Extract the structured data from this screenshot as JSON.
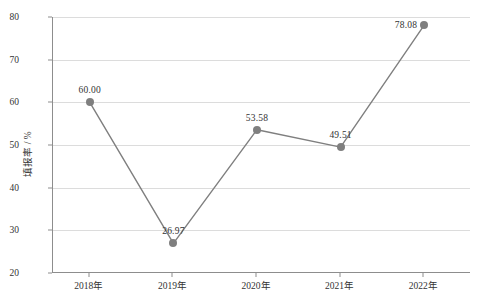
{
  "chart_data": {
    "type": "line",
    "title": "",
    "xlabel": "",
    "ylabel": "填报率 / %",
    "categories": [
      "2018年",
      "2019年",
      "2020年",
      "2021年",
      "2022年"
    ],
    "values": [
      60.0,
      26.97,
      53.58,
      49.51,
      78.08
    ],
    "point_labels": [
      "60.00",
      "26.97",
      "53.58",
      "49.51",
      "78.08"
    ],
    "point_label_positions": [
      "above",
      "above",
      "above",
      "above",
      "left"
    ],
    "ylim": [
      20,
      80
    ],
    "yticks": [
      20,
      30,
      40,
      50,
      60,
      70,
      80
    ],
    "ytick_labels": [
      "20",
      "30",
      "40",
      "50",
      "60",
      "70",
      "80"
    ],
    "grid": "horizontal",
    "legend": "none",
    "series": [
      {
        "name": "填报率",
        "values": [
          60.0,
          26.97,
          53.58,
          49.51,
          78.08
        ],
        "line_color": "#7f7f7f",
        "marker_color": "#7f7f7f",
        "marker": "circle"
      }
    ],
    "colors": {
      "line": "#7f7f7f",
      "marker": "#7f7f7f",
      "grid": "#dcdcdc",
      "axis": "#8d8d8d",
      "text": "#333333",
      "background": "#ffffff"
    }
  }
}
